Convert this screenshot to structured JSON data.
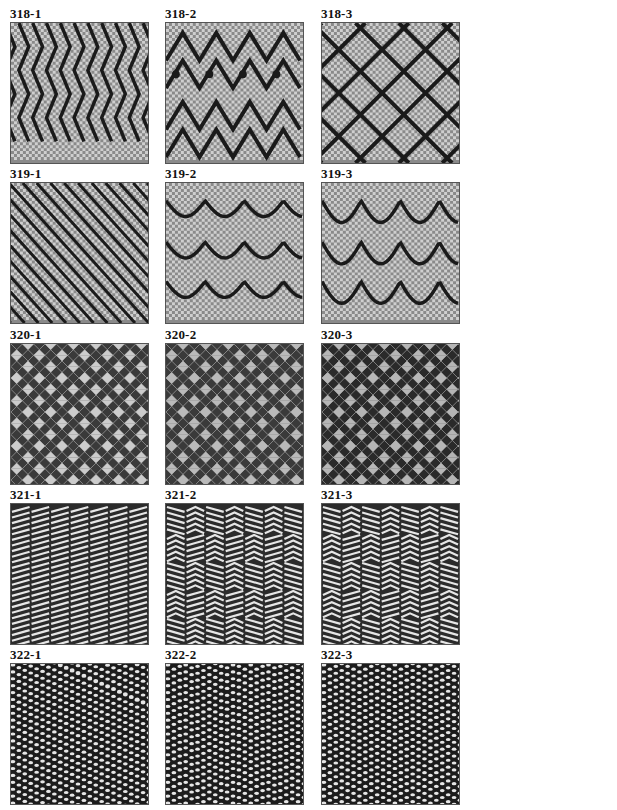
{
  "page": {
    "background": "#ffffff",
    "columns_x": [
      10,
      165,
      321
    ],
    "rows_y": [
      7,
      167,
      328,
      488,
      648
    ]
  },
  "swatches": [
    {
      "label": "318-1",
      "pattern": "zigzag-vertical"
    },
    {
      "label": "318-2",
      "pattern": "diamond-wave"
    },
    {
      "label": "318-3",
      "pattern": "diamond-lattice"
    },
    {
      "label": "319-1",
      "pattern": "diagonal-twill"
    },
    {
      "label": "319-2",
      "pattern": "wave-horizontal"
    },
    {
      "label": "319-3",
      "pattern": "wave-horizontal-deep"
    },
    {
      "label": "320-1",
      "pattern": "geometric-lattice"
    },
    {
      "label": "320-2",
      "pattern": "geometric-checker"
    },
    {
      "label": "320-3",
      "pattern": "geometric-checker-dark"
    },
    {
      "label": "321-1",
      "pattern": "block-diagonal"
    },
    {
      "label": "321-2",
      "pattern": "block-arrows"
    },
    {
      "label": "321-3",
      "pattern": "block-arrows-alt"
    },
    {
      "label": "322-1",
      "pattern": "dense-twill"
    },
    {
      "label": "322-2",
      "pattern": "dense-herringbone"
    },
    {
      "label": "322-3",
      "pattern": "dense-herringbone-alt"
    }
  ],
  "colors": {
    "dark": "#1a1a1a",
    "mid": "#8a8a8a",
    "light": "#e6e6e6"
  }
}
